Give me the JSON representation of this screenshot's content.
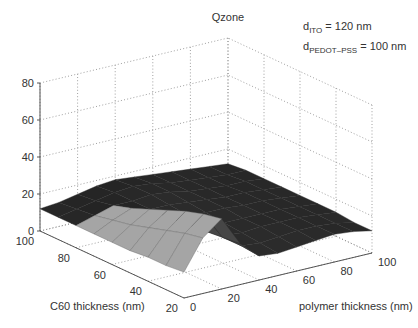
{
  "chart_data": {
    "type": "surface3d",
    "title": "Qzone",
    "xlabel": "polymer thickness (nm)",
    "ylabel": "C60 thickness (nm)",
    "zlabel": "",
    "annotations": [
      {
        "base": "d",
        "sub": "ITO",
        "rest": " = 120 nm"
      },
      {
        "base": "d",
        "sub": "PEDOT–PSS",
        "rest": " = 100 nm"
      }
    ],
    "x_ticks": [
      0,
      20,
      40,
      60,
      80,
      100
    ],
    "y_ticks": [
      20,
      40,
      60,
      80,
      100
    ],
    "z_ticks": [
      0,
      20,
      40,
      60,
      80
    ],
    "xlim": [
      0,
      100
    ],
    "ylim": [
      20,
      100
    ],
    "zlim": [
      0,
      80
    ],
    "grid": true,
    "colormap": "gray",
    "surface": {
      "x": [
        0,
        10,
        20,
        30,
        40,
        50,
        60,
        70,
        80,
        90,
        100
      ],
      "y": [
        20,
        30,
        40,
        50,
        60,
        70,
        80,
        90,
        100
      ],
      "z": [
        [
          14,
          30,
          38,
          22,
          13,
          12,
          13,
          14,
          15,
          14,
          12
        ],
        [
          13,
          28,
          36,
          21,
          14,
          13,
          14,
          15,
          15,
          14,
          12
        ],
        [
          13,
          25,
          33,
          20,
          15,
          14,
          15,
          15,
          15,
          14,
          13
        ],
        [
          12,
          22,
          29,
          19,
          16,
          15,
          15,
          15,
          15,
          14,
          13
        ],
        [
          12,
          19,
          25,
          18,
          17,
          16,
          16,
          15,
          15,
          14,
          13
        ],
        [
          12,
          17,
          21,
          18,
          18,
          17,
          16,
          15,
          15,
          14,
          13
        ],
        [
          12,
          15,
          18,
          18,
          19,
          18,
          16,
          15,
          14,
          14,
          13
        ],
        [
          12,
          14,
          16,
          18,
          19,
          18,
          16,
          15,
          14,
          13,
          13
        ],
        [
          12,
          13,
          15,
          17,
          18,
          17,
          16,
          15,
          14,
          13,
          12
        ]
      ]
    }
  },
  "labels": {
    "title": "Qzone",
    "x_axis": "polymer thickness (nm)",
    "y_axis": "C60 thickness (nm)"
  },
  "colors": {
    "surface_dark": "#111111",
    "surface_light": "#a8a8a8",
    "grid": "#888888",
    "axis": "#444444"
  }
}
